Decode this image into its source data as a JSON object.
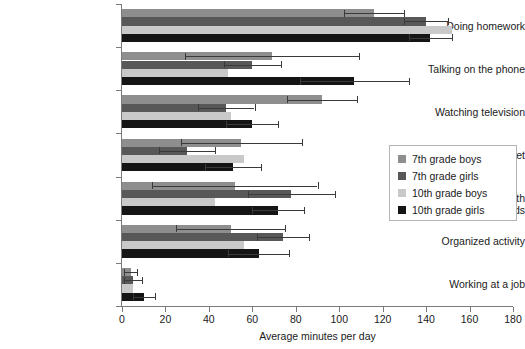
{
  "chart_data": {
    "type": "bar",
    "orientation": "horizontal",
    "title": "",
    "xlabel": "Average minutes per day",
    "ylabel": "",
    "xlim": [
      0,
      180
    ],
    "xticks": [
      0,
      20,
      40,
      60,
      80,
      100,
      120,
      140,
      160,
      180
    ],
    "grid": false,
    "legend_position": "right",
    "categories": [
      "Doing homework",
      "Talking on the phone",
      "Watching television",
      "Using the Internet",
      "Hanging out with friends",
      "Organized activity",
      "Working at a job"
    ],
    "series": [
      {
        "name": "7th grade boys",
        "color": "#8e8e8e",
        "values": [
          116,
          69,
          92,
          55,
          52,
          50,
          4
        ],
        "errors": [
          14,
          40,
          16,
          28,
          38,
          25,
          3
        ]
      },
      {
        "name": "7th grade girls",
        "color": "#585858",
        "values": [
          140,
          60,
          48,
          30,
          78,
          74,
          5
        ],
        "errors": [
          10,
          13,
          13,
          13,
          20,
          12,
          4
        ]
      },
      {
        "name": "10th grade boys",
        "color": "#c9c9c9",
        "values": [
          152,
          49,
          50,
          56,
          43,
          56,
          5
        ]
      },
      {
        "name": "10th grade girls",
        "color": "#151515",
        "values": [
          142,
          107,
          60,
          51,
          72,
          63,
          10
        ],
        "errors": [
          10,
          25,
          12,
          13,
          12,
          14,
          5
        ]
      }
    ]
  },
  "legend": {
    "items": [
      {
        "label": "7th grade boys",
        "color": "#8e8e8e"
      },
      {
        "label": "7th grade girls",
        "color": "#585858"
      },
      {
        "label": "10th grade boys",
        "color": "#c9c9c9"
      },
      {
        "label": "10th grade girls",
        "color": "#151515"
      }
    ]
  }
}
